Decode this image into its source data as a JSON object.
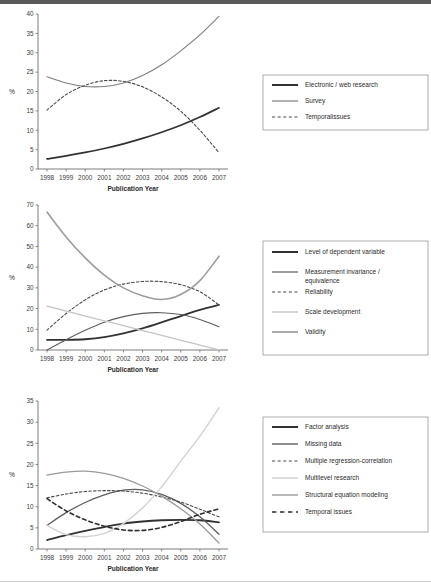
{
  "figure": {
    "axis_title": "Publication Year",
    "y_axis_label": "%",
    "years": [
      "1998",
      "1999",
      "2000",
      "2001",
      "2002",
      "2003",
      "2004",
      "2005",
      "2006",
      "2007"
    ]
  },
  "chart_data": [
    {
      "type": "line",
      "title": "",
      "xlabel": "Publication Year",
      "ylabel": "%",
      "x": [
        1998,
        1999,
        2000,
        2001,
        2002,
        2003,
        2004,
        2005,
        2006,
        2007
      ],
      "xlim": [
        1998,
        2007
      ],
      "ylim": [
        0,
        40
      ],
      "yticks": [
        0,
        5,
        10,
        15,
        20,
        25,
        30,
        35,
        40
      ],
      "grid": false,
      "legend_position": "right",
      "series": [
        {
          "name": "Electronic / web research",
          "style": "solid",
          "width": 1.7,
          "color": "#323232",
          "values": [
            2.6,
            3.4,
            4.3,
            5.3,
            6.5,
            7.9,
            9.5,
            11.3,
            13.4,
            15.8
          ]
        },
        {
          "name": "Survey",
          "style": "solid",
          "width": 1.1,
          "color": "#7d7d7d",
          "values": [
            23.8,
            22.2,
            21.3,
            21.3,
            22.2,
            24.1,
            26.9,
            30.5,
            34.6,
            39.4
          ]
        },
        {
          "name": "Temporalissues",
          "style": "dashed",
          "width": 1.1,
          "color": "#4a4a4a",
          "values": [
            15.2,
            19.2,
            21.6,
            22.8,
            22.6,
            21.2,
            18.6,
            14.9,
            10.0,
            4.2
          ]
        }
      ]
    },
    {
      "type": "line",
      "title": "",
      "xlabel": "Publication Year",
      "ylabel": "%",
      "x": [
        1998,
        1999,
        2000,
        2001,
        2002,
        2003,
        2004,
        2005,
        2006,
        2007
      ],
      "xlim": [
        1998,
        2007
      ],
      "ylim": [
        0,
        70
      ],
      "yticks": [
        0,
        10,
        20,
        30,
        40,
        50,
        60,
        70
      ],
      "grid": false,
      "legend_position": "right",
      "series": [
        {
          "name": "Level of dependent variable",
          "style": "solid",
          "width": 1.8,
          "color": "#323232",
          "values": [
            4.9,
            4.9,
            5.2,
            6.2,
            8.0,
            10.4,
            13.3,
            16.4,
            19.4,
            21.8
          ]
        },
        {
          "name": "Measurement invariance / equivalence",
          "style": "solid",
          "width": 1.1,
          "color": "#5d5d5d",
          "values": [
            0.0,
            5.0,
            9.5,
            13.4,
            16.1,
            17.7,
            18.0,
            17.1,
            14.7,
            11.2
          ]
        },
        {
          "name": "Reliability",
          "style": "dashed",
          "width": 1.1,
          "color": "#4a4a4a",
          "values": [
            9.6,
            17.6,
            24.2,
            29.0,
            31.8,
            33.1,
            33.0,
            31.5,
            28.1,
            21.8
          ]
        },
        {
          "name": "Scale development",
          "style": "solid",
          "width": 1.3,
          "color": "#c4c4c4",
          "values": [
            21.2,
            18.8,
            16.4,
            14.1,
            11.8,
            9.4,
            7.1,
            4.7,
            2.4,
            0.1
          ]
        },
        {
          "name": "Validity",
          "style": "solid",
          "width": 1.6,
          "color": "#9c9c9c",
          "values": [
            66.6,
            54.6,
            44.5,
            36.2,
            30.0,
            26.2,
            24.4,
            26.8,
            33.5,
            45.3
          ]
        }
      ]
    },
    {
      "type": "line",
      "title": "",
      "xlabel": "Publication Year",
      "ylabel": "%",
      "x": [
        1998,
        1999,
        2000,
        2001,
        2002,
        2003,
        2004,
        2005,
        2006,
        2007
      ],
      "xlim": [
        1998,
        2007
      ],
      "ylim": [
        0,
        35
      ],
      "yticks": [
        0,
        5,
        10,
        15,
        20,
        25,
        30,
        35
      ],
      "grid": false,
      "legend_position": "right",
      "series": [
        {
          "name": "Factor analysis",
          "style": "solid",
          "width": 1.8,
          "color": "#323232",
          "values": [
            2.1,
            3.3,
            4.3,
            5.2,
            6.0,
            6.5,
            6.8,
            6.9,
            6.8,
            6.3
          ]
        },
        {
          "name": "Missing data",
          "style": "solid",
          "width": 1.3,
          "color": "#5d5d5d",
          "values": [
            5.6,
            8.6,
            11.0,
            12.8,
            13.9,
            14.0,
            12.9,
            10.8,
            7.6,
            3.5
          ]
        },
        {
          "name": "Multiple regression-correlation",
          "style": "dashed",
          "width": 1.1,
          "color": "#4a4a4a",
          "values": [
            12.1,
            13.0,
            13.6,
            13.8,
            13.7,
            13.2,
            12.3,
            11.1,
            9.4,
            7.6
          ]
        },
        {
          "name": "Multilevel research",
          "style": "solid",
          "width": 1.4,
          "color": "#d2d2d2",
          "values": [
            5.6,
            3.4,
            2.9,
            3.7,
            6.0,
            9.7,
            14.7,
            20.8,
            26.7,
            33.4
          ]
        },
        {
          "name": "Structural equation modeling",
          "style": "solid",
          "width": 1.3,
          "color": "#9a9a9a",
          "values": [
            17.5,
            18.2,
            18.4,
            17.9,
            16.7,
            14.9,
            12.5,
            9.5,
            5.9,
            1.4
          ]
        },
        {
          "name": "Temporal issues",
          "style": "dashed",
          "width": 1.6,
          "color": "#2e2e2e",
          "values": [
            11.9,
            9.0,
            6.9,
            5.4,
            4.5,
            4.4,
            5.1,
            6.5,
            8.2,
            9.5
          ]
        }
      ]
    }
  ],
  "legends": [
    {
      "items": [
        {
          "label": "Electronic / web research",
          "style": "solid",
          "color": "#323232",
          "width": 2.0
        },
        {
          "label": "Survey",
          "style": "solid",
          "color": "#7d7d7d",
          "width": 1.2
        },
        {
          "label": "Temporalissues",
          "style": "dashed",
          "color": "#4a4a4a",
          "width": 1.2
        }
      ]
    },
    {
      "items": [
        {
          "label": "Level of dependent variable",
          "style": "solid",
          "color": "#323232",
          "width": 2.0
        },
        {
          "label": "Measurement invariance /",
          "label2": "equivalence",
          "style": "solid",
          "color": "#5d5d5d",
          "width": 1.2
        },
        {
          "label": "Reliability",
          "style": "dashed",
          "color": "#4a4a4a",
          "width": 1.2
        },
        {
          "label": "Scale development",
          "style": "solid",
          "color": "#c4c4c4",
          "width": 1.4
        },
        {
          "label": "Validity",
          "style": "solid",
          "color": "#9c9c9c",
          "width": 1.7
        }
      ]
    },
    {
      "items": [
        {
          "label": "Factor analysis",
          "style": "solid",
          "color": "#323232",
          "width": 2.0
        },
        {
          "label": "Missing data",
          "style": "solid",
          "color": "#5d5d5d",
          "width": 1.4
        },
        {
          "label": "Multiple regression-correlation",
          "style": "dashed",
          "color": "#4a4a4a",
          "width": 1.2
        },
        {
          "label": "Multilevel research",
          "style": "solid",
          "color": "#d2d2d2",
          "width": 1.5
        },
        {
          "label": "Structural equation modeling",
          "style": "solid",
          "color": "#9a9a9a",
          "width": 1.4
        },
        {
          "label": "Temporal issues",
          "style": "dashed",
          "color": "#2e2e2e",
          "width": 1.7
        }
      ]
    }
  ]
}
